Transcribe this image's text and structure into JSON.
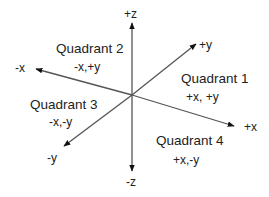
{
  "diagram": {
    "type": "3d-coordinate-axes",
    "colors": {
      "axis_line": "#555555",
      "arrowhead": "#111111",
      "text": "#222222",
      "background": "#ffffff"
    },
    "origin": {
      "x": 132,
      "y": 95
    },
    "axes": {
      "pos_z": {
        "label": "+z",
        "tip": {
          "x": 132,
          "y": 22
        }
      },
      "neg_z": {
        "label": "-z",
        "tip": {
          "x": 132,
          "y": 172
        }
      },
      "neg_x": {
        "label": "-x",
        "tip": {
          "x": 35,
          "y": 69
        }
      },
      "pos_x": {
        "label": "+x",
        "tip": {
          "x": 235,
          "y": 126
        }
      },
      "pos_y": {
        "label": "+y",
        "tip": {
          "x": 197,
          "y": 43
        }
      },
      "neg_y": {
        "label": "-y",
        "tip": {
          "x": 63,
          "y": 147
        }
      }
    },
    "quadrants": [
      {
        "id": 1,
        "title": "Quadrant 1",
        "signs": "+x, +y"
      },
      {
        "id": 2,
        "title": "Quadrant 2",
        "signs": "-x,+y"
      },
      {
        "id": 3,
        "title": "Quadrant 3",
        "signs": "-x,-y"
      },
      {
        "id": 4,
        "title": "Quadrant 4",
        "signs": "+x,-y"
      }
    ]
  }
}
